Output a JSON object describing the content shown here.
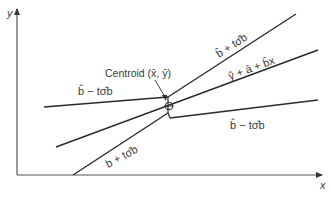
{
  "diagram": {
    "type": "regression-confidence-band",
    "colors": {
      "line": "#2a2a2a",
      "axis": "#555555",
      "text": "#3a3a3a",
      "background": "#ffffff"
    },
    "axes": {
      "x_label": "x",
      "y_label": "y"
    },
    "centroid_label": "Centroid (x̄, ȳ)",
    "labels": {
      "upper_right_line": "b̂ + tσ̂b",
      "fitted_line": "ŷ + â + b̂x",
      "lower_right_line": "b̂ − tσ̂b",
      "upper_left_line": "b̂ − tσ̂b",
      "lower_left_line": "b + tσ̂b"
    }
  }
}
